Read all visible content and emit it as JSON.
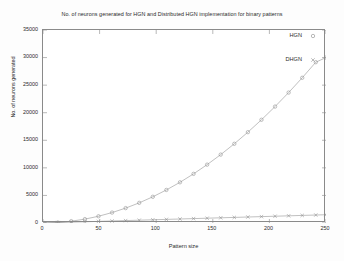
{
  "chart_data": {
    "type": "line",
    "title": "No. of neurons generated for HGN and Distributed HGN implementation for binary patterns",
    "xlabel": "Pattern size",
    "ylabel": "No. of neurons generated",
    "xlim": [
      0,
      250
    ],
    "ylim": [
      0,
      35000
    ],
    "xticks": [
      0,
      50,
      100,
      150,
      200,
      250
    ],
    "xtick_labels": [
      "0",
      "50",
      "100",
      "150",
      "200",
      "250"
    ],
    "yticks": [
      0,
      5000,
      10000,
      15000,
      20000,
      25000,
      30000,
      35000
    ],
    "ytick_labels": [
      "0",
      "5000",
      "10000",
      "15000",
      "20000",
      "25000",
      "30000",
      "35000"
    ],
    "grid": false,
    "legend_position": "top-right-inside",
    "series": [
      {
        "name": "HGN",
        "marker": "circle",
        "color": "#8c8c8c",
        "x": [
          1,
          13,
          25,
          37,
          49,
          61,
          73,
          85,
          97,
          109,
          121,
          133,
          145,
          157,
          169,
          181,
          193,
          205,
          217,
          229,
          241,
          250
        ],
        "values": [
          1,
          91,
          325,
          703,
          1225,
          1891,
          2701,
          3655,
          4753,
          5995,
          7381,
          8911,
          10585,
          12403,
          14365,
          16471,
          18721,
          21115,
          23653,
          26335,
          29161,
          30000
        ]
      },
      {
        "name": "DHGN",
        "marker": "cross",
        "color": "#8c8c8c",
        "x": [
          1,
          13,
          25,
          37,
          49,
          61,
          73,
          85,
          97,
          109,
          121,
          133,
          145,
          157,
          169,
          181,
          193,
          205,
          217,
          229,
          241,
          250
        ],
        "values": [
          6,
          78,
          150,
          222,
          294,
          366,
          438,
          510,
          582,
          654,
          726,
          798,
          870,
          942,
          1014,
          1086,
          1158,
          1230,
          1302,
          1374,
          1446,
          1500
        ]
      }
    ]
  },
  "legend": {
    "entries": [
      {
        "label": "HGN",
        "marker": "circle"
      },
      {
        "label": "DHGN",
        "marker": "cross"
      }
    ]
  }
}
